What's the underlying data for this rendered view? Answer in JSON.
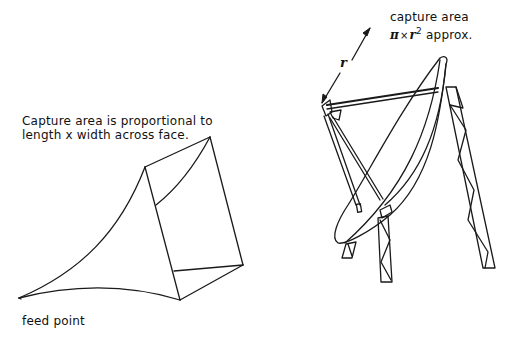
{
  "diagram": {
    "horn": {
      "caption_line1": "Capture area is proportional to",
      "caption_line2": "length x width across face.",
      "feed_label": "feed point"
    },
    "dish": {
      "caption_line1": "capture area",
      "formula_pi": "π",
      "formula_times": "×",
      "formula_r": "r",
      "formula_exp": "2",
      "formula_suffix": "approx.",
      "radius_label": "r"
    },
    "colors": {
      "line": "#1a1a1a",
      "background": "#ffffff"
    }
  }
}
